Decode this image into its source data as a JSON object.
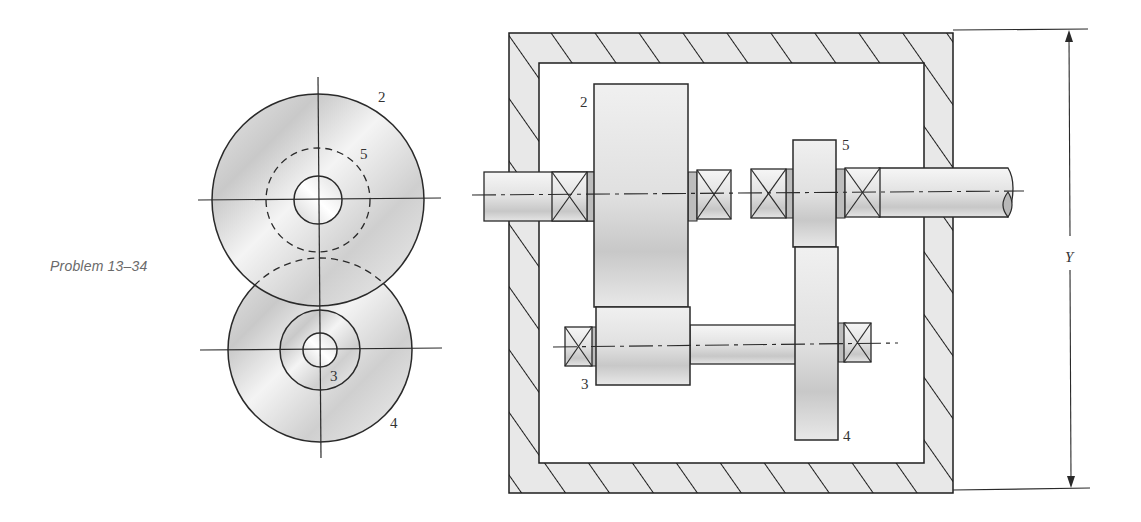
{
  "figure": {
    "caption": "Problem 13–34",
    "end_view": {
      "gear_labels": {
        "g2": "2",
        "g5": "5",
        "g3": "3",
        "g4": "4"
      }
    },
    "side_view": {
      "gear_labels": {
        "g2": "2",
        "g5": "5",
        "g3": "3",
        "g4": "4"
      },
      "dimension_label": "Y"
    },
    "colors": {
      "line": "#2a2a2a",
      "gear_fill_light": "#f2f2f2",
      "gear_fill_dark": "#c8c8c8",
      "housing_fill": "#e6e6e6",
      "caption_text": "#6a6a6a"
    }
  }
}
